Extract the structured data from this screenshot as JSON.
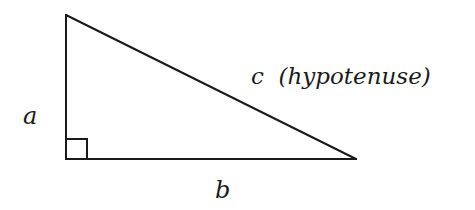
{
  "diagram": {
    "type": "geometry",
    "stroke_color": "#1a1a1a",
    "background_color": "#ffffff",
    "vertices": {
      "top": {
        "x": 66,
        "y": 15
      },
      "right_angle": {
        "x": 66,
        "y": 159
      },
      "right": {
        "x": 356,
        "y": 159
      }
    },
    "right_angle_marker": {
      "x": 66,
      "y": 139,
      "size": 21
    },
    "labels": {
      "a": "a",
      "b": "b",
      "c": "c  (hypotenuse)"
    },
    "sides": [
      {
        "name": "a",
        "role": "leg",
        "orientation": "vertical"
      },
      {
        "name": "b",
        "role": "leg",
        "orientation": "horizontal"
      },
      {
        "name": "c",
        "role": "hypotenuse",
        "orientation": "diagonal"
      }
    ]
  }
}
